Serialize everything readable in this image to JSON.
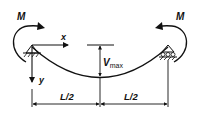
{
  "diagram": {
    "type": "beam-deflection",
    "labels": {
      "moment_left": "M",
      "moment_right": "M",
      "x_axis": "x",
      "y_axis": "y",
      "v_max_main": "V",
      "v_max_sub": "max",
      "half_span_left": "L/2",
      "half_span_right": "L/2"
    },
    "supports": {
      "left": "pin",
      "right": "roller"
    },
    "colors": {
      "stroke": "#111111",
      "background": "#ffffff"
    }
  }
}
